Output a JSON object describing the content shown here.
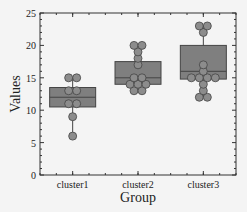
{
  "chart_data": {
    "type": "box",
    "title": "",
    "xlabel": "Group",
    "ylabel": "Values",
    "ylim": [
      0,
      25
    ],
    "yticks": [
      0,
      5,
      10,
      15,
      20,
      25
    ],
    "grid": false,
    "legend": null,
    "categories": [
      "cluster1",
      "cluster2",
      "cluster3"
    ],
    "series": [
      {
        "name": "cluster1",
        "points": [
          15,
          15,
          13,
          13,
          11,
          11,
          9,
          6
        ],
        "box": {
          "q1": 10.5,
          "median": 12,
          "q3": 13.5,
          "whisker_low": 6,
          "whisker_high": 15
        }
      },
      {
        "name": "cluster2",
        "points": [
          20,
          20,
          19,
          18,
          17,
          15,
          15,
          14,
          14,
          14,
          13,
          13
        ],
        "box": {
          "q1": 14,
          "median": 15,
          "q3": 17.5,
          "whisker_low": 13,
          "whisker_high": 20
        }
      },
      {
        "name": "cluster3",
        "points": [
          23,
          23,
          22,
          17,
          16,
          15,
          15,
          15,
          15,
          14,
          13,
          12,
          12
        ],
        "box": {
          "q1": 14.8,
          "median": 16,
          "q3": 20,
          "whisker_low": 12,
          "whisker_high": 23
        }
      }
    ],
    "colors": {
      "box": "#7f7f7f",
      "point": "#8c8c8c",
      "edge": "#444444"
    }
  }
}
